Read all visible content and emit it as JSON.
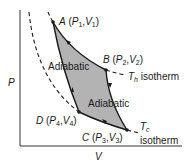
{
  "diagram": {
    "type": "Carnot cycle P-V diagram",
    "axes": {
      "y_label": "P",
      "x_label": "V"
    },
    "points": {
      "A": {
        "label": "A",
        "p": "P",
        "p_sub": "1",
        "v": "V",
        "v_sub": "1"
      },
      "B": {
        "label": "B",
        "p": "P",
        "p_sub": "2",
        "v": "V",
        "v_sub": "2"
      },
      "C": {
        "label": "C",
        "p": "P",
        "p_sub": "3",
        "v": "V",
        "v_sub": "3"
      },
      "D": {
        "label": "D",
        "p": "P",
        "p_sub": "4",
        "v": "V",
        "v_sub": "4"
      }
    },
    "process_labels": {
      "adiabatic_left": "Adiabatic",
      "adiabatic_right": "Adiabatic"
    },
    "isotherms": {
      "hot": {
        "symbol": "T",
        "sub": "h",
        "text": "isotherm"
      },
      "cold": {
        "symbol": "T",
        "sub": "c",
        "text": "isotherm"
      }
    },
    "colors": {
      "fill": "#b3b3b3",
      "line": "#1a1a1a"
    }
  }
}
